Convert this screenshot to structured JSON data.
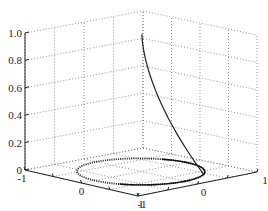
{
  "chart_data": {
    "type": "line",
    "title": "",
    "dimensions": "3d",
    "xlabel": "",
    "ylabel": "",
    "zlabel": "",
    "x_ticks": [
      "-1",
      "0",
      "1"
    ],
    "y_ticks": [
      "-1",
      "0",
      "1"
    ],
    "z_ticks": [
      "0",
      "0.2",
      "0.4",
      "0.6",
      "0.8",
      "1.0"
    ],
    "xlim": [
      -1,
      1
    ],
    "ylim": [
      -1,
      1
    ],
    "zlim": [
      0,
      1
    ],
    "grid": true,
    "legend": null,
    "series": [
      {
        "name": "trajectory",
        "style": "solid",
        "description": "curve rising from the unit circle at z=0 to the axis at z=1",
        "points": [
          [
            0.0,
            0.0,
            1.0
          ],
          [
            0.1,
            0.05,
            0.8
          ],
          [
            0.35,
            0.15,
            0.55
          ],
          [
            0.7,
            0.3,
            0.3
          ],
          [
            0.95,
            0.3,
            0.1
          ],
          [
            1.0,
            0.0,
            0.02
          ],
          [
            0.7,
            -0.7,
            0.0
          ]
        ]
      },
      {
        "name": "unit circle",
        "style": "dotted",
        "description": "circle of radius 1 in the z=0 plane",
        "points": "x=cos(t), y=sin(t), z=0"
      }
    ]
  },
  "labels": {
    "z": [
      "0",
      "0.2",
      "0.4",
      "0.6",
      "0.8",
      "1.0"
    ],
    "x_left": [
      "-1",
      "0",
      "1"
    ],
    "y_right": [
      "-1",
      "0",
      "1"
    ]
  }
}
